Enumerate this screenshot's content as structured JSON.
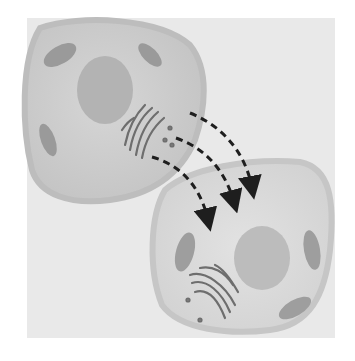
{
  "diagram": {
    "type": "cell-transfer-illustration",
    "elements": [
      {
        "name": "donor-cell",
        "contains": [
          "nucleus",
          "golgi-apparatus",
          "mitochondria"
        ]
      },
      {
        "name": "recipient-cell",
        "contains": [
          "nucleus",
          "golgi-apparatus",
          "mitochondria"
        ]
      },
      {
        "name": "transfer-arrows",
        "count": 3,
        "style": "dashed",
        "direction": "donor-to-recipient"
      }
    ],
    "colors": {
      "background": "#e9e9e9",
      "cell_fill": "#cfcfcf",
      "cell_membrane": "#bdbdbd",
      "nucleus": "#a9a9a9",
      "organelle": "#8f8f8f",
      "golgi": "#6e6e6e",
      "arrow": "#1e1e1e"
    }
  }
}
